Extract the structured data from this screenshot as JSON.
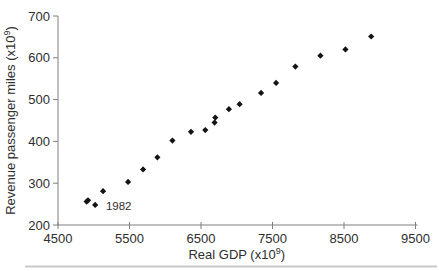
{
  "figure": {
    "background": "#ffffff",
    "divider_color": "#c9c9c9"
  },
  "chart_data": {
    "type": "scatter",
    "title": "",
    "xlabel": {
      "prefix": "Real GDP (x10",
      "sup": "9",
      "suffix": ")"
    },
    "ylabel": {
      "prefix": "Revenue passenger miles (x10",
      "sup": "9",
      "suffix": ")"
    },
    "xlim": [
      4500,
      9500
    ],
    "ylim": [
      200,
      700
    ],
    "x_ticks": [
      4500,
      5500,
      6500,
      7500,
      8500,
      9500
    ],
    "y_ticks": [
      200,
      300,
      400,
      500,
      600,
      700
    ],
    "grid": false,
    "legend": "none",
    "marker": {
      "shape": "diamond",
      "color": "#141414",
      "half_size": 3.1
    },
    "axis_color": "#7f7f7f",
    "text_color": "#2e2e2e",
    "tick_font_px": 13,
    "annotation_font_px": 11.5,
    "points": [
      {
        "x": 4900,
        "y": 256
      },
      {
        "x": 4920,
        "y": 259
      },
      {
        "x": 5020,
        "y": 248
      },
      {
        "x": 5130,
        "y": 281
      },
      {
        "x": 5480,
        "y": 303
      },
      {
        "x": 5690,
        "y": 333
      },
      {
        "x": 5890,
        "y": 362
      },
      {
        "x": 6100,
        "y": 402
      },
      {
        "x": 6360,
        "y": 423
      },
      {
        "x": 6560,
        "y": 427
      },
      {
        "x": 6690,
        "y": 445
      },
      {
        "x": 6700,
        "y": 457
      },
      {
        "x": 6890,
        "y": 477
      },
      {
        "x": 7040,
        "y": 489
      },
      {
        "x": 7340,
        "y": 516
      },
      {
        "x": 7550,
        "y": 540
      },
      {
        "x": 7820,
        "y": 579
      },
      {
        "x": 8170,
        "y": 605
      },
      {
        "x": 8520,
        "y": 620
      },
      {
        "x": 8880,
        "y": 651
      }
    ],
    "annotations": [
      {
        "text": "1982",
        "x": 5170,
        "y": 245
      }
    ]
  }
}
